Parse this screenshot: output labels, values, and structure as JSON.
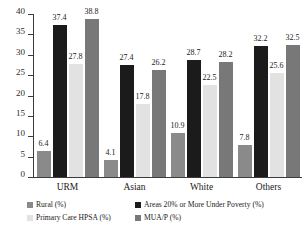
{
  "chart_data": {
    "type": "bar",
    "title": "",
    "subtitle": "",
    "xlabel": "",
    "ylabel": "",
    "ylim": [
      0,
      40
    ],
    "ytick_labels": [
      "0",
      "5",
      "10",
      "15",
      "20",
      "25",
      "30",
      "35",
      "40"
    ],
    "ytick_values": [
      0,
      5,
      10,
      15,
      20,
      25,
      30,
      35,
      40
    ],
    "grid": false,
    "legend_position": "bottom",
    "categories": [
      "URM",
      "Asian",
      "White",
      "Others"
    ],
    "series": [
      {
        "name": "Rural (%)",
        "color": "#8a8a8a",
        "values": [
          6.4,
          4.1,
          10.9,
          7.8
        ],
        "labels": [
          "6.4",
          "4.1",
          "10.9",
          "7.8"
        ]
      },
      {
        "name": "Areas 20% or More Under Poverty (%)",
        "color": "#1b1b1b",
        "values": [
          37.4,
          27.4,
          28.7,
          32.2
        ],
        "labels": [
          "37.4",
          "27.4",
          "28.7",
          "32.2"
        ]
      },
      {
        "name": "Primary Care HPSA (%)",
        "color": "#e2e2e2",
        "values": [
          27.8,
          17.8,
          22.5,
          25.6
        ],
        "labels": [
          "27.8",
          "17.8",
          "22.5",
          "25.6"
        ]
      },
      {
        "name": "MUA/P (%)",
        "color": "#787878",
        "values": [
          38.8,
          26.2,
          28.2,
          32.5
        ],
        "labels": [
          "38.8",
          "26.2",
          "28.2",
          "32.5"
        ]
      }
    ],
    "legend": [
      {
        "label": "Rural (%)",
        "color": "#8a8a8a"
      },
      {
        "label": "Areas 20% or More Under Poverty (%)",
        "color": "#1b1b1b"
      },
      {
        "label": "Primary Care HPSA (%)",
        "color": "#e2e2e2"
      },
      {
        "label": "MUA/P (%)",
        "color": "#787878"
      }
    ]
  }
}
